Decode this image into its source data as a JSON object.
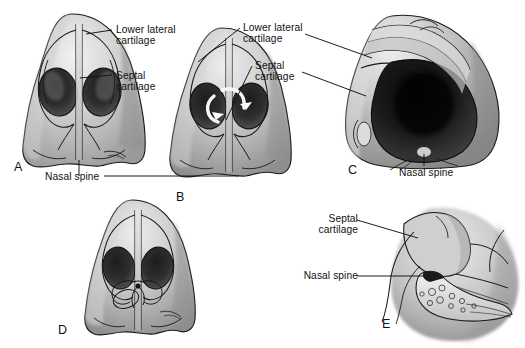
{
  "figure": {
    "style": "grayscale airbrush medical illustration",
    "background_color": "#ffffff",
    "ink_color": "#111111",
    "panel_count": 5
  },
  "panels": [
    {
      "id": "A",
      "letter": "A",
      "view": "basal view of nose, caudal septum midline",
      "x": 14,
      "y": 160
    },
    {
      "id": "B",
      "letter": "B",
      "view": "basal view with white curved arrows showing septal repositioning maneuver",
      "x": 176,
      "y": 190
    },
    {
      "id": "C",
      "letter": "C",
      "view": "oblique basal view, deviated septum with wide nostril aperture",
      "x": 348,
      "y": 163
    },
    {
      "id": "D",
      "letter": "D",
      "view": "basal view after suture fixation of septum to nasal spine",
      "x": 58,
      "y": 323
    },
    {
      "id": "E",
      "letter": "E",
      "view": "sagittal section showing septal cartilage seated on nasal spine",
      "x": 382,
      "y": 317
    }
  ],
  "labels": [
    {
      "id": "a-lower-lateral",
      "text": "Lower lateral\ncartilage",
      "panel": "A",
      "x": 116,
      "y": 24,
      "align": "left"
    },
    {
      "id": "a-septal",
      "text": "Septal\ncartilage",
      "panel": "A",
      "x": 116,
      "y": 70,
      "align": "left"
    },
    {
      "id": "a-nasal-spine",
      "text": "Nasal spine",
      "panel": "A",
      "x": 45,
      "y": 172,
      "align": "left"
    },
    {
      "id": "c-lower-lateral",
      "text": "Lower lateral\ncartilage",
      "panel": "C",
      "x": 243,
      "y": 22,
      "align": "left"
    },
    {
      "id": "c-septal",
      "text": "Septal\ncartilage",
      "panel": "C",
      "x": 255,
      "y": 60,
      "align": "left"
    },
    {
      "id": "c-nasal-spine",
      "text": "Nasal spine",
      "panel": "C",
      "x": 399,
      "y": 168,
      "align": "left"
    },
    {
      "id": "e-septal",
      "text": "Septal\ncartilage",
      "panel": "E",
      "x": 316,
      "y": 214,
      "align": "left"
    },
    {
      "id": "e-nasal-spine",
      "text": "Nasal spine",
      "panel": "E",
      "x": 316,
      "y": 270,
      "align": "left"
    }
  ],
  "anatomy_terms": [
    "Lower lateral cartilage",
    "Septal cartilage",
    "Nasal spine"
  ]
}
